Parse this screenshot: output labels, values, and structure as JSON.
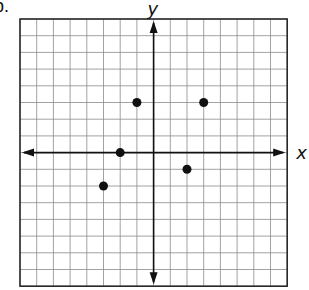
{
  "problem_label": "b.",
  "chart_data": {
    "type": "scatter",
    "title": "",
    "xlabel": "x",
    "ylabel": "y",
    "xlim": [
      -8,
      8
    ],
    "ylim": [
      -8,
      8
    ],
    "grid": true,
    "grid_step": 1,
    "points": [
      {
        "x": -1,
        "y": 3
      },
      {
        "x": 3,
        "y": 3
      },
      {
        "x": -2,
        "y": 0
      },
      {
        "x": 2,
        "y": -1
      },
      {
        "x": -3,
        "y": -2
      }
    ],
    "colors": {
      "grid": "#8a8a8a",
      "axis": "#111111",
      "point": "#111111"
    }
  }
}
